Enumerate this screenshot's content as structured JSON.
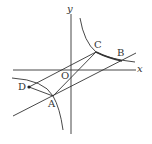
{
  "diagram": {
    "type": "coordinate-geometry",
    "axes": {
      "x_label": "x",
      "y_label": "y",
      "origin_label": "O"
    },
    "points": [
      {
        "name": "A",
        "x": 53,
        "y": 96
      },
      {
        "name": "B",
        "x": 122,
        "y": 61
      },
      {
        "name": "C",
        "x": 96,
        "y": 52
      },
      {
        "name": "D",
        "x": 29,
        "y": 87
      }
    ],
    "curves": [
      "hyperbola branch (first quadrant)",
      "hyperbola branch (third quadrant)"
    ],
    "lines": [
      "line through O, C (extended)",
      "line through A, B (extended)",
      "segment A-C",
      "segment D-A",
      "segment C-B"
    ],
    "colors": {
      "stroke": "#333333",
      "background": "#ffffff"
    }
  }
}
